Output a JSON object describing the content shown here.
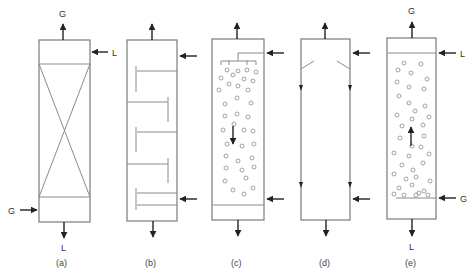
{
  "figure": {
    "colors": {
      "shell": "#7a7a7a",
      "arrow": "#222222",
      "bubble": "#8c8c8c",
      "text": "#333333"
    }
  },
  "streams": {
    "gas": "G",
    "liquid": "L"
  },
  "columns": [
    {
      "id": "a",
      "caption": "(a)",
      "type": "packed-column",
      "labels": {
        "top_out": "G",
        "top_in": "L",
        "bottom_in": "G",
        "bottom_out": "L"
      }
    },
    {
      "id": "b",
      "caption": "(b)",
      "type": "plate-column",
      "labels": {
        "top_out": "",
        "top_in": "",
        "bottom_in": "",
        "bottom_out": ""
      }
    },
    {
      "id": "c",
      "caption": "(c)",
      "type": "spray-column",
      "labels": {
        "top_out": "",
        "top_in": "",
        "bottom_in": "",
        "bottom_out": ""
      }
    },
    {
      "id": "d",
      "caption": "(d)",
      "type": "wetted-wall-column",
      "labels": {
        "top_out": "",
        "top_in": "",
        "bottom_in": "",
        "bottom_out": ""
      }
    },
    {
      "id": "e",
      "caption": "(e)",
      "type": "bubble-column",
      "labels": {
        "top_out": "G",
        "top_in": "L",
        "bottom_in": "G",
        "bottom_out": "L"
      }
    }
  ]
}
